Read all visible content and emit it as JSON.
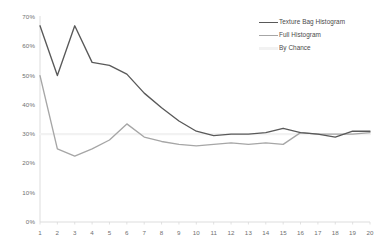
{
  "chart_data": {
    "type": "line",
    "title": "",
    "subtitle": "",
    "xlabel": "",
    "ylabel": "",
    "categories": [
      1,
      2,
      3,
      4,
      5,
      6,
      7,
      8,
      9,
      10,
      11,
      12,
      13,
      14,
      15,
      16,
      17,
      18,
      19,
      20
    ],
    "x": [
      1,
      2,
      3,
      4,
      5,
      6,
      7,
      8,
      9,
      10,
      11,
      12,
      13,
      14,
      15,
      16,
      17,
      18,
      19,
      20
    ],
    "xlim": [
      1,
      20
    ],
    "ylim": [
      0,
      70
    ],
    "y_tick_labels": [
      "70%",
      "60%",
      "50%",
      "40%",
      "30%",
      "20%",
      "10%",
      "0%"
    ],
    "y_tick_values": [
      70,
      60,
      50,
      40,
      30,
      20,
      10,
      0
    ],
    "x_tick_labels": [
      "1",
      "2",
      "3",
      "4",
      "5",
      "6",
      "7",
      "8",
      "9",
      "10",
      "11",
      "12",
      "13",
      "14",
      "15",
      "16",
      "17",
      "18",
      "19",
      "20"
    ],
    "grid": false,
    "legend_position": "top-right",
    "series": [
      {
        "name": "Texture Bag Histogram",
        "color": "#595959",
        "values": [
          67.0,
          50.0,
          67.0,
          54.5,
          53.5,
          50.5,
          44.0,
          39.0,
          34.5,
          31.0,
          29.5,
          30.0,
          30.0,
          30.5,
          32.0,
          30.5,
          30.0,
          29.0,
          31.0,
          31.0
        ]
      },
      {
        "name": "Full Histogram",
        "color": "#a6a6a6",
        "values": [
          50.0,
          25.0,
          22.5,
          25.0,
          28.0,
          33.5,
          29.0,
          27.5,
          26.5,
          26.0,
          26.5,
          27.0,
          26.5,
          27.0,
          26.5,
          30.5,
          30.0,
          30.0,
          30.0,
          30.5
        ]
      },
      {
        "name": "By Chance",
        "color": "#f2f2f2",
        "values": [
          30.0,
          30.0,
          30.0,
          30.0,
          30.0,
          30.0,
          30.0,
          30.0,
          30.0,
          30.0,
          30.0,
          30.0,
          30.0,
          30.0,
          30.0,
          30.0,
          30.0,
          30.0,
          30.0,
          30.0
        ]
      }
    ]
  },
  "legend": {
    "items": [
      {
        "label": "Texture Bag Histogram",
        "color": "#595959"
      },
      {
        "label": "Full Histogram",
        "color": "#a6a6a6"
      },
      {
        "label": "By Chance",
        "color": "#f2f2f2"
      }
    ]
  },
  "axes": {
    "axis_color": "#d9d9d9",
    "tick_label_color": "#6f6f6f"
  }
}
